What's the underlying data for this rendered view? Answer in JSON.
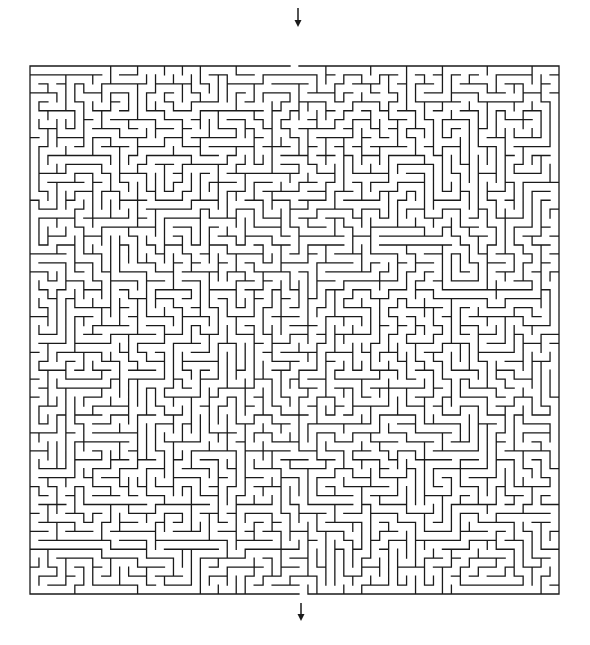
{
  "maze": {
    "title": "Maze puzzle",
    "origin_x": 30,
    "origin_y": 66,
    "width_px": 529,
    "height_px": 528,
    "cols": 59,
    "rows": 59,
    "entrance": {
      "side": "top",
      "col": 29,
      "arrow": {
        "x": 298,
        "y1": 8,
        "y2": 27
      }
    },
    "exit": {
      "side": "bottom",
      "col": 30,
      "arrow": {
        "x": 301,
        "y1": 603,
        "y2": 621
      }
    },
    "seed": 20240611,
    "wall_color": "#1a1a1a",
    "background_color": "#ffffff"
  }
}
